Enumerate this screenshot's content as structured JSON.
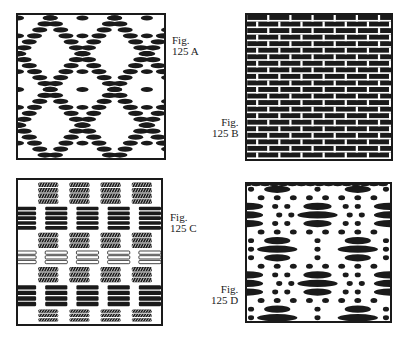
{
  "figures": [
    {
      "id": "A",
      "caption_line1": "Fig.",
      "caption_line2": "125 A",
      "pattern": "diamond-twill-dashes",
      "description": "Diagonal diamond arrangement of dark oval floats on white ground"
    },
    {
      "id": "B",
      "caption_line1": "Fig.",
      "caption_line2": "125 B",
      "pattern": "brick-staggered-floats",
      "description": "Dense staggered rows of dark elongated floats, brick-like"
    },
    {
      "id": "C",
      "caption_line1": "Fig.",
      "caption_line2": "125 C",
      "pattern": "block-checker-hatched",
      "description": "Alternating blocks of solid bars, hatched bars and outlined bars in checker layout"
    },
    {
      "id": "D",
      "caption_line1": "Fig.",
      "caption_line2": "125 D",
      "pattern": "spot-and-float-rows",
      "description": "Rows of dots alternating with long dark floats in offset groups"
    }
  ],
  "colors": {
    "ink": "#1a1a1a",
    "paper": "#ffffff"
  }
}
